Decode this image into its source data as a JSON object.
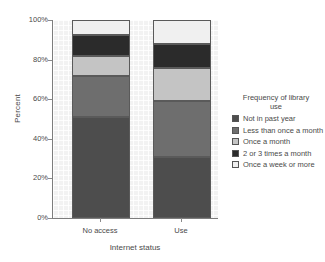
{
  "chart_data": {
    "type": "bar",
    "subtype": "stacked-percentage",
    "title": "",
    "xlabel": "Internet status",
    "ylabel": "Percent",
    "categories": [
      "No access",
      "Use"
    ],
    "ylim": [
      0,
      100
    ],
    "ytick_labels": [
      "0%",
      "20%",
      "40%",
      "60%",
      "80%",
      "100%"
    ],
    "ytick_values": [
      0,
      20,
      40,
      60,
      80,
      100
    ],
    "grid": true,
    "legend_position": "right",
    "legend_title": "Frequency of library use",
    "series": [
      {
        "name": "Not in past year",
        "color": "#4d4d4d",
        "values": [
          51,
          31
        ]
      },
      {
        "name": "Less than once a month",
        "color": "#6e6e6e",
        "values": [
          20.5,
          28
        ]
      },
      {
        "name": "Once a month",
        "color": "#c4c4c4",
        "values": [
          10.5,
          17
        ]
      },
      {
        "name": "2 or 3 times a month",
        "color": "#2b2b2b",
        "values": [
          10.5,
          12
        ]
      },
      {
        "name": "Once a week or more",
        "color": "#f0f0f0",
        "values": [
          7.5,
          12
        ]
      }
    ]
  },
  "legend": {
    "title_line1": "Frequency of library",
    "title_line2": "use",
    "items": [
      {
        "label": "Not in past year",
        "color": "#4d4d4d"
      },
      {
        "label": "Less than once a month",
        "color": "#6e6e6e"
      },
      {
        "label": "Once a month",
        "color": "#c4c4c4"
      },
      {
        "label": "2 or 3 times a month",
        "color": "#2b2b2b"
      },
      {
        "label": "Once a week or more",
        "color": "#f0f0f0"
      }
    ]
  },
  "axes": {
    "y_title": "Percent",
    "x_title": "Internet status"
  }
}
